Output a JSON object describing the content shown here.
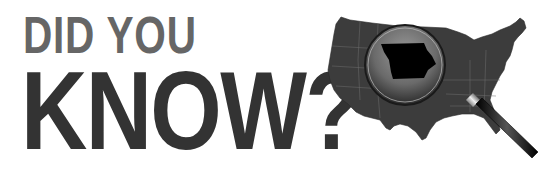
{
  "headline": {
    "line1": "DID YOU",
    "line2": "KNOW?"
  },
  "illustration": {
    "subject": "us-map-with-magnifier",
    "highlighted_state": "Iowa",
    "colors": {
      "map": "#3a3a3a",
      "state_borders": "#6e6e6e",
      "highlighted_state": "#000000",
      "handle": "#111111"
    }
  }
}
